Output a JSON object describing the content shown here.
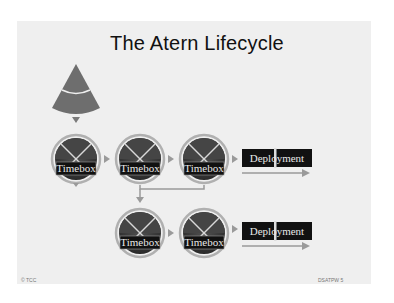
{
  "slide": {
    "title": "The Atern Lifecycle",
    "footer_left": "© TCC",
    "footer_right": "DSATPW 5"
  },
  "diagram": {
    "colors": {
      "background": "#efefef",
      "shape_fill": "#6e6e6e",
      "circle_fill": "#3a3a3a",
      "label_bg": "#111111",
      "connector": "#9a9a9a",
      "ring": "#b5b5b5"
    },
    "pre_project_shape": "triangle-sector",
    "row1": {
      "timeboxes": [
        "Timebox",
        "Timebox",
        "Timebox"
      ],
      "deployment": "Deployment"
    },
    "row2": {
      "timeboxes": [
        "Timebox",
        "Timebox"
      ],
      "deployment": "Deployment"
    }
  }
}
